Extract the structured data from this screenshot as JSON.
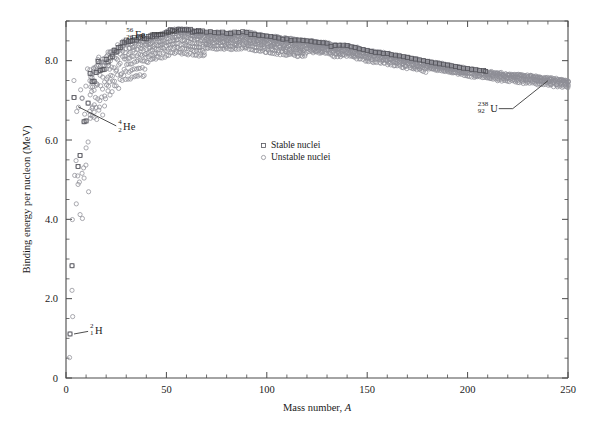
{
  "figure": {
    "background": "#ffffff",
    "frame_color": "#4a4a4a"
  },
  "chart_data": {
    "type": "scatter",
    "title": "",
    "xlabel": "Mass number, A",
    "ylabel": "Binding energy per nucleon (MeV)",
    "xlim": [
      0,
      250
    ],
    "ylim": [
      0,
      9
    ],
    "grid": false,
    "xticks": [
      0,
      50,
      100,
      150,
      200,
      250
    ],
    "xticklabels": [
      "0",
      "50",
      "100",
      "150",
      "200",
      "250"
    ],
    "x_minor_step": 10,
    "yticks": [
      0,
      2,
      4,
      6,
      8
    ],
    "yticklabels": [
      "0",
      "2.0",
      "4.0",
      "6.0",
      "8.0"
    ],
    "y_minor_step": 0.5,
    "legend": {
      "position": "inside-center-left",
      "entries": [
        {
          "name": "Stable nuclei",
          "marker": "square",
          "color": "#55555c"
        },
        {
          "name": "Unstable nuclei",
          "marker": "circle",
          "color": "#8e8e96"
        }
      ]
    },
    "annotations": [
      {
        "name": "iron-56",
        "superscript": "56",
        "subscript": "26",
        "symbol": "Fe",
        "x": 56,
        "y": 8.79,
        "label_x": 30,
        "label_y": 8.62
      },
      {
        "name": "helium-4",
        "superscript": "4",
        "subscript": "2",
        "symbol": "He",
        "x": 4,
        "y": 7.07,
        "label_x": 26,
        "label_y": 6.28
      },
      {
        "name": "hydrogen-2",
        "superscript": "2",
        "subscript": "1",
        "symbol": "H",
        "x": 2,
        "y": 1.11,
        "label_x": 12,
        "label_y": 1.15
      },
      {
        "name": "uranium-238",
        "superscript": "238",
        "subscript": "92",
        "symbol": "U",
        "x": 238,
        "y": 7.57,
        "label_x": 205,
        "label_y": 6.74
      }
    ],
    "series": [
      {
        "name": "Stable nuclei",
        "marker": "square",
        "points": [
          [
            2,
            1.11
          ],
          [
            3,
            2.83
          ],
          [
            4,
            7.07
          ],
          [
            6,
            5.33
          ],
          [
            7,
            5.61
          ],
          [
            9,
            6.46
          ],
          [
            10,
            6.48
          ],
          [
            11,
            6.93
          ],
          [
            12,
            7.68
          ],
          [
            13,
            7.47
          ],
          [
            14,
            7.48
          ],
          [
            15,
            7.7
          ],
          [
            16,
            7.98
          ],
          [
            17,
            7.75
          ],
          [
            18,
            7.77
          ],
          [
            19,
            7.78
          ],
          [
            20,
            8.03
          ],
          [
            21,
            7.97
          ],
          [
            22,
            8.07
          ],
          [
            23,
            8.11
          ],
          [
            24,
            8.26
          ],
          [
            25,
            8.22
          ],
          [
            26,
            8.33
          ],
          [
            27,
            8.33
          ],
          [
            28,
            8.45
          ],
          [
            29,
            8.45
          ],
          [
            30,
            8.52
          ],
          [
            31,
            8.48
          ],
          [
            32,
            8.49
          ],
          [
            33,
            8.5
          ],
          [
            34,
            8.58
          ],
          [
            35,
            8.52
          ],
          [
            36,
            8.58
          ],
          [
            37,
            8.57
          ],
          [
            38,
            8.61
          ],
          [
            39,
            8.56
          ],
          [
            40,
            8.55
          ],
          [
            41,
            8.61
          ],
          [
            42,
            8.62
          ],
          [
            43,
            8.6
          ],
          [
            44,
            8.66
          ],
          [
            45,
            8.62
          ],
          [
            46,
            8.66
          ],
          [
            47,
            8.66
          ],
          [
            48,
            8.67
          ],
          [
            50,
            8.7
          ],
          [
            51,
            8.71
          ],
          [
            52,
            8.78
          ],
          [
            53,
            8.76
          ],
          [
            54,
            8.74
          ],
          [
            55,
            8.75
          ],
          [
            56,
            8.79
          ],
          [
            57,
            8.77
          ],
          [
            58,
            8.79
          ],
          [
            59,
            8.77
          ],
          [
            60,
            8.78
          ],
          [
            61,
            8.77
          ],
          [
            62,
            8.79
          ],
          [
            63,
            8.72
          ],
          [
            64,
            8.74
          ],
          [
            65,
            8.74
          ],
          [
            66,
            8.76
          ],
          [
            67,
            8.73
          ],
          [
            68,
            8.75
          ],
          [
            70,
            8.72
          ],
          [
            72,
            8.73
          ],
          [
            74,
            8.71
          ],
          [
            76,
            8.7
          ],
          [
            78,
            8.72
          ],
          [
            80,
            8.69
          ],
          [
            82,
            8.68
          ],
          [
            84,
            8.72
          ],
          [
            86,
            8.71
          ],
          [
            88,
            8.73
          ],
          [
            90,
            8.71
          ],
          [
            92,
            8.66
          ],
          [
            94,
            8.66
          ],
          [
            96,
            8.64
          ],
          [
            98,
            8.63
          ],
          [
            100,
            8.62
          ],
          [
            102,
            8.61
          ],
          [
            104,
            8.59
          ],
          [
            106,
            8.57
          ],
          [
            108,
            8.54
          ],
          [
            110,
            8.55
          ],
          [
            112,
            8.51
          ],
          [
            114,
            8.52
          ],
          [
            116,
            8.52
          ],
          [
            118,
            8.51
          ],
          [
            120,
            8.5
          ],
          [
            122,
            8.49
          ],
          [
            124,
            8.47
          ],
          [
            126,
            8.46
          ],
          [
            128,
            8.45
          ],
          [
            130,
            8.44
          ],
          [
            132,
            8.36
          ],
          [
            134,
            8.38
          ],
          [
            136,
            8.39
          ],
          [
            138,
            8.39
          ],
          [
            140,
            8.38
          ],
          [
            142,
            8.35
          ],
          [
            144,
            8.33
          ],
          [
            146,
            8.3
          ],
          [
            148,
            8.28
          ],
          [
            150,
            8.26
          ],
          [
            152,
            8.23
          ],
          [
            154,
            8.21
          ],
          [
            156,
            8.2
          ],
          [
            158,
            8.18
          ],
          [
            160,
            8.18
          ],
          [
            162,
            8.15
          ],
          [
            164,
            8.14
          ],
          [
            166,
            8.12
          ],
          [
            168,
            8.1
          ],
          [
            170,
            8.08
          ],
          [
            172,
            8.06
          ],
          [
            174,
            8.04
          ],
          [
            176,
            8.02
          ],
          [
            178,
            8.0
          ],
          [
            180,
            7.98
          ],
          [
            182,
            7.96
          ],
          [
            184,
            7.94
          ],
          [
            186,
            7.92
          ],
          [
            188,
            7.91
          ],
          [
            190,
            7.89
          ],
          [
            192,
            7.87
          ],
          [
            194,
            7.85
          ],
          [
            196,
            7.83
          ],
          [
            198,
            7.81
          ],
          [
            200,
            7.8
          ],
          [
            202,
            7.78
          ],
          [
            204,
            7.77
          ],
          [
            206,
            7.75
          ],
          [
            208,
            7.75
          ],
          [
            209,
            7.73
          ]
        ]
      },
      {
        "name": "Unstable nuclei",
        "marker": "circle",
        "note": "Dense band of ~1600 nuclides; generated procedurally from the valley-of-stability envelope with per-A spread below the stable line.",
        "envelope": [
          [
            2,
            1.11
          ],
          [
            4,
            7.07
          ],
          [
            8,
            7.06
          ],
          [
            12,
            7.68
          ],
          [
            16,
            7.98
          ],
          [
            20,
            8.03
          ],
          [
            24,
            8.26
          ],
          [
            28,
            8.45
          ],
          [
            32,
            8.49
          ],
          [
            36,
            8.58
          ],
          [
            40,
            8.55
          ],
          [
            44,
            8.66
          ],
          [
            48,
            8.67
          ],
          [
            52,
            8.78
          ],
          [
            56,
            8.79
          ],
          [
            60,
            8.78
          ],
          [
            64,
            8.74
          ],
          [
            70,
            8.72
          ],
          [
            80,
            8.69
          ],
          [
            90,
            8.71
          ],
          [
            100,
            8.62
          ],
          [
            110,
            8.55
          ],
          [
            120,
            8.5
          ],
          [
            126,
            8.46
          ],
          [
            130,
            8.44
          ],
          [
            134,
            8.38
          ],
          [
            140,
            8.38
          ],
          [
            150,
            8.26
          ],
          [
            160,
            8.18
          ],
          [
            170,
            8.08
          ],
          [
            180,
            7.98
          ],
          [
            190,
            7.89
          ],
          [
            200,
            7.8
          ],
          [
            210,
            7.72
          ],
          [
            220,
            7.66
          ],
          [
            230,
            7.62
          ],
          [
            238,
            7.57
          ],
          [
            244,
            7.54
          ],
          [
            250,
            7.5
          ]
        ]
      }
    ]
  }
}
